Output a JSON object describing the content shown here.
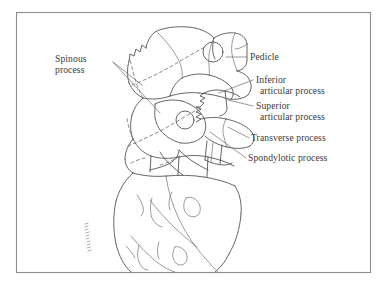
{
  "figure": {
    "background_color": "#ffffff",
    "border_color": "#8c8c92",
    "ink_color": "#4a4a50",
    "label_text_color": "#3a3a3c",
    "artist_signature": "illegible vertical signature"
  },
  "labels": {
    "spinous_process_line1": "Spinous",
    "spinous_process_line2": "process",
    "pedicle": "Pedicle",
    "inferior_articular_line1": "Inferior",
    "inferior_articular_line2": "articular process",
    "superior_articular_line1": "Superior",
    "superior_articular_line2": "articular process",
    "transverse_process": "Transverse process",
    "spondylotic_process": "Spondylotic process"
  }
}
